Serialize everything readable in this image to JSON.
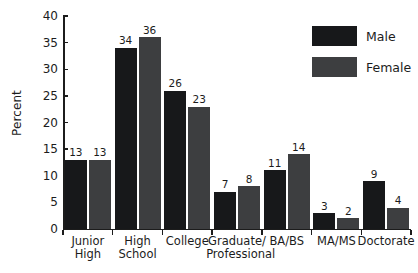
{
  "chart_data": {
    "type": "bar",
    "title": "",
    "subtitle": "",
    "xlabel": "",
    "ylabel": "Percent",
    "ylim": [
      0,
      40
    ],
    "ytick_step": 5,
    "yticks": [
      0,
      5,
      10,
      15,
      20,
      25,
      30,
      35,
      40
    ],
    "grid": false,
    "legend_position": "top-right",
    "categories": [
      "Junior High",
      "High School",
      "College",
      "Graduate/ Professional",
      "BA/BS",
      "MA/MS",
      "Doctorate"
    ],
    "category_lines": [
      [
        "Junior",
        "High"
      ],
      [
        "High",
        "School"
      ],
      [
        "College",
        ""
      ],
      [
        "Graduate/",
        "Professional"
      ],
      [
        "BA/BS",
        ""
      ],
      [
        "MA/MS",
        ""
      ],
      [
        "Doctorate",
        ""
      ]
    ],
    "series": [
      {
        "name": "Male",
        "color": "#17181a",
        "values": [
          13,
          34,
          26,
          7,
          11,
          3,
          9
        ]
      },
      {
        "name": "Female",
        "color": "#3d3e40",
        "values": [
          13,
          36,
          23,
          8,
          14,
          2,
          4
        ]
      }
    ]
  },
  "legend": {
    "entries": [
      {
        "label": "Male",
        "color": "#17181a"
      },
      {
        "label": "Female",
        "color": "#3d3e40"
      }
    ]
  },
  "axis": {
    "y_title": "Percent",
    "y_tick_labels": [
      "0",
      "5",
      "10",
      "15",
      "20",
      "25",
      "30",
      "35",
      "40"
    ]
  },
  "colors": {
    "male": "#17181a",
    "female": "#3d3e40",
    "axis": "#1c1c1c",
    "background": "#ffffff"
  }
}
